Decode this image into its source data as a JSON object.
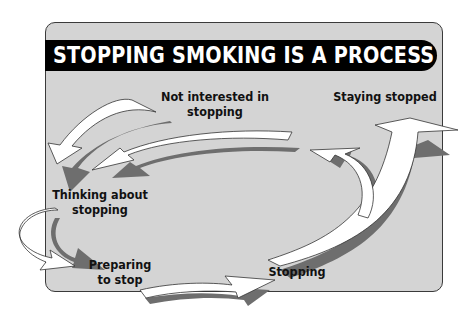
{
  "title": "STOPPING SMOKING IS A PROCESS",
  "stages": [
    {
      "id": "not-interested",
      "line1": "Not interested in",
      "line2": "stopping"
    },
    {
      "id": "thinking",
      "line1": "Thinking about",
      "line2": "stopping"
    },
    {
      "id": "preparing",
      "line1": "Preparing",
      "line2": "to stop"
    },
    {
      "id": "stopping",
      "line1": "Stopping",
      "line2": ""
    },
    {
      "id": "staying-stopped",
      "line1": "Staying stopped",
      "line2": ""
    }
  ],
  "colors": {
    "panel": "#d4d4d4",
    "title_bar": "#000000",
    "title_text": "#ffffff",
    "arrow_fill": "#ffffff",
    "arrow_shadow": "#6e6e6e"
  }
}
